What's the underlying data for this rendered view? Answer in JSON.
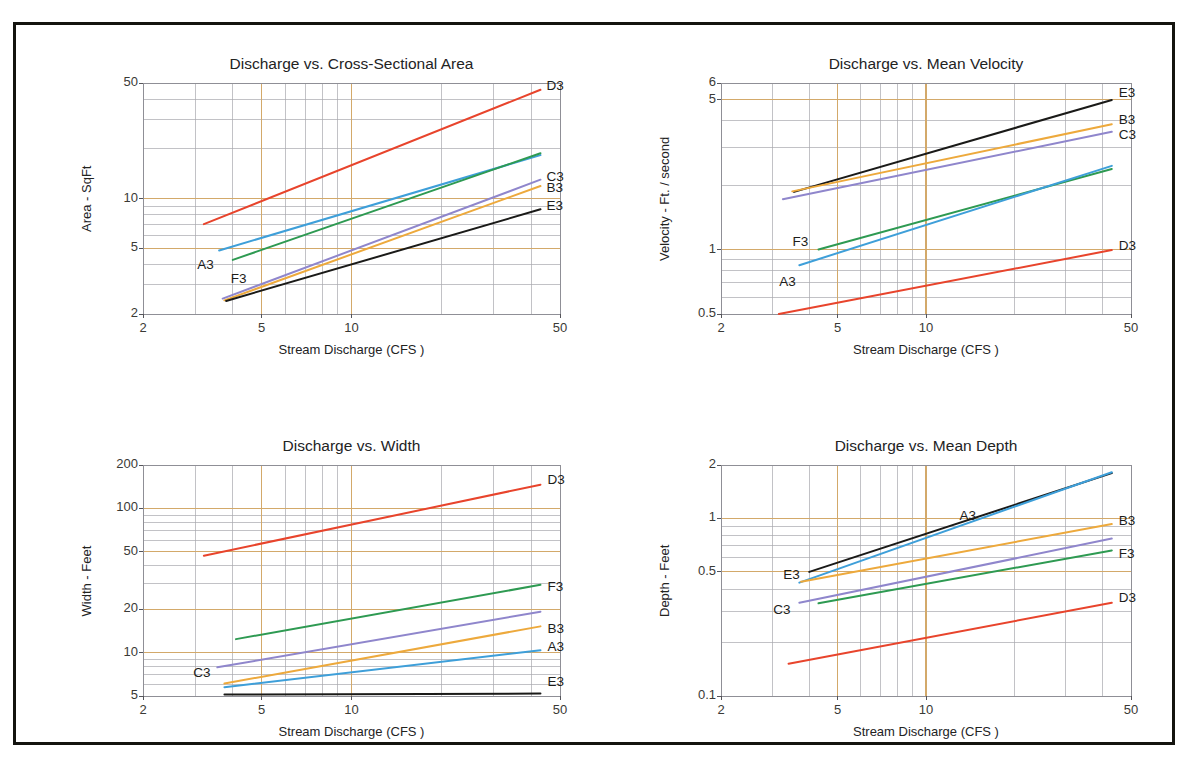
{
  "figure": {
    "border_color": "#14140f",
    "background": "#ffffff"
  },
  "palette": {
    "A3": "#3e9fd9",
    "B3": "#eda93c",
    "C3": "#8f86cc",
    "D3": "#e8442c",
    "E3": "#1a1a18",
    "F3": "#2e9a52",
    "grid_major": "#d3a96a",
    "grid_minor": "#a8a8ae",
    "axis": "#8f8f96"
  },
  "charts": [
    {
      "id": "area",
      "title": "Discharge vs. Cross-Sectional Area",
      "ylabel": "Area - SqFt",
      "xlabel": "Stream Discharge (CFS )",
      "x_ticks": [
        "2",
        "5",
        "10",
        "50"
      ],
      "x_tick_values": [
        2,
        5,
        10,
        50
      ],
      "y_ticks": [
        "50",
        "10",
        "5",
        "2"
      ],
      "y_tick_values": [
        50,
        10,
        5,
        2
      ],
      "xlim": [
        2,
        50
      ],
      "ylim": [
        2,
        50
      ],
      "series": [
        {
          "name": "A3",
          "color": "#3e9fd9",
          "x": [
            3.6,
            43
          ],
          "y": [
            4.85,
            18.3
          ],
          "label_pos": "left",
          "label_dx": -22,
          "label_dy": 16
        },
        {
          "name": "F3",
          "color": "#2e9a52",
          "x": [
            4.0,
            43
          ],
          "y": [
            4.25,
            18.8
          ],
          "label_pos": "left",
          "label_dx": -2,
          "label_dy": 20
        },
        {
          "name": "D3",
          "color": "#e8442c",
          "x": [
            3.2,
            43
          ],
          "y": [
            7.0,
            45.5
          ],
          "label_pos": "right",
          "label_dx": 6,
          "label_dy": -3
        },
        {
          "name": "C3",
          "color": "#8f86cc",
          "x": [
            3.7,
            43
          ],
          "y": [
            2.48,
            13.0
          ],
          "label_pos": "right",
          "label_dx": 6,
          "label_dy": -2
        },
        {
          "name": "B3",
          "color": "#eda93c",
          "x": [
            3.75,
            43
          ],
          "y": [
            2.42,
            11.9
          ],
          "label_pos": "right",
          "label_dx": 6,
          "label_dy": 3
        },
        {
          "name": "E3",
          "color": "#1a1a18",
          "x": [
            3.8,
            43
          ],
          "y": [
            2.4,
            8.6
          ],
          "label_pos": "right",
          "label_dx": 6,
          "label_dy": -2
        }
      ]
    },
    {
      "id": "velocity",
      "title": "Discharge vs. Mean Velocity",
      "ylabel": "Velocity - Ft. / second",
      "xlabel": "Stream Discharge (CFS )",
      "x_ticks": [
        "2",
        "5",
        "10",
        "50"
      ],
      "x_tick_values": [
        2,
        5,
        10,
        50
      ],
      "y_ticks": [
        "6",
        "5",
        "1",
        "0.5"
      ],
      "y_tick_values": [
        6,
        5,
        1,
        0.5
      ],
      "xlim": [
        2,
        50
      ],
      "ylim": [
        0.5,
        6
      ],
      "series": [
        {
          "name": "E3",
          "color": "#1a1a18",
          "x": [
            3.55,
            43
          ],
          "y": [
            1.86,
            5.0
          ],
          "label_pos": "right",
          "label_dx": 7,
          "label_dy": -6
        },
        {
          "name": "B3",
          "color": "#eda93c",
          "x": [
            3.5,
            43
          ],
          "y": [
            1.87,
            3.85
          ],
          "label_pos": "right",
          "label_dx": 7,
          "label_dy": -3
        },
        {
          "name": "C3",
          "color": "#8f86cc",
          "x": [
            3.25,
            43
          ],
          "y": [
            1.72,
            3.55
          ],
          "label_pos": "right",
          "label_dx": 7,
          "label_dy": 4
        },
        {
          "name": "F3",
          "color": "#2e9a52",
          "x": [
            4.3,
            43
          ],
          "y": [
            1.0,
            2.38
          ],
          "label_pos": "left",
          "label_dx": -26,
          "label_dy": -7
        },
        {
          "name": "A3",
          "color": "#3e9fd9",
          "x": [
            3.7,
            43
          ],
          "y": [
            0.845,
            2.46
          ],
          "label_pos": "left",
          "label_dx": -20,
          "label_dy": 18
        },
        {
          "name": "D3",
          "color": "#e8442c",
          "x": [
            3.15,
            43
          ],
          "y": [
            0.5,
            0.995
          ],
          "label_pos": "right",
          "label_dx": 7,
          "label_dy": -3
        }
      ]
    },
    {
      "id": "width",
      "title": "Discharge vs. Width",
      "ylabel": "Width - Feet",
      "xlabel": "Stream Discharge (CFS )",
      "x_ticks": [
        "2",
        "5",
        "10",
        "50"
      ],
      "x_tick_values": [
        2,
        5,
        10,
        50
      ],
      "y_ticks": [
        "200",
        "100",
        "50",
        "20",
        "10",
        "5"
      ],
      "y_tick_values": [
        200,
        100,
        50,
        20,
        10,
        5
      ],
      "xlim": [
        2,
        50
      ],
      "ylim": [
        5,
        200
      ],
      "series": [
        {
          "name": "D3",
          "color": "#e8442c",
          "x": [
            3.2,
            43
          ],
          "y": [
            47,
            146
          ],
          "label_pos": "right",
          "label_dx": 7,
          "label_dy": -4
        },
        {
          "name": "F3",
          "color": "#2e9a52",
          "x": [
            4.1,
            43
          ],
          "y": [
            12.4,
            29.5
          ],
          "label_pos": "right",
          "label_dx": 7,
          "label_dy": 3
        },
        {
          "name": "C3",
          "color": "#8f86cc",
          "x": [
            3.55,
            43
          ],
          "y": [
            7.9,
            19.2
          ],
          "label_pos": "left",
          "label_dx": -24,
          "label_dy": 7
        },
        {
          "name": "B3",
          "color": "#eda93c",
          "x": [
            3.75,
            43
          ],
          "y": [
            6.1,
            15.2
          ],
          "label_pos": "right",
          "label_dx": 7,
          "label_dy": 4
        },
        {
          "name": "A3",
          "color": "#3e9fd9",
          "x": [
            3.75,
            43
          ],
          "y": [
            5.75,
            10.4
          ],
          "label_pos": "right",
          "label_dx": 7,
          "label_dy": -2
        },
        {
          "name": "E3",
          "color": "#1a1a18",
          "x": [
            3.75,
            43
          ],
          "y": [
            5.12,
            5.2
          ],
          "label_pos": "right",
          "label_dx": 7,
          "label_dy": -11
        }
      ]
    },
    {
      "id": "depth",
      "title": "Discharge vs. Mean Depth",
      "ylabel": "Depth - Feet",
      "xlabel": "Stream Discharge (CFS )",
      "x_ticks": [
        "2",
        "5",
        "10",
        "50"
      ],
      "x_tick_values": [
        2,
        5,
        10,
        50
      ],
      "y_ticks": [
        "2",
        "1",
        "0.5",
        "0.1"
      ],
      "y_tick_values": [
        2,
        1,
        0.5,
        0.1
      ],
      "xlim": [
        2,
        50
      ],
      "ylim": [
        0.1,
        2
      ],
      "series": [
        {
          "name": "E3",
          "color": "#1a1a18",
          "x": [
            4.0,
            43
          ],
          "y": [
            0.5,
            1.8
          ],
          "label_pos": "left",
          "label_dx": -26,
          "label_dy": 4
        },
        {
          "name": "A3",
          "color": "#3e9fd9",
          "x": [
            3.7,
            43
          ],
          "y": [
            0.435,
            1.82
          ],
          "label_pos": "mid",
          "label_dx": 4,
          "label_dy": -10
        },
        {
          "name": "B3",
          "color": "#eda93c",
          "x": [
            3.75,
            43
          ],
          "y": [
            0.44,
            0.93
          ],
          "label_pos": "right",
          "label_dx": 7,
          "label_dy": -2
        },
        {
          "name": "C3",
          "color": "#8f86cc",
          "x": [
            3.7,
            43
          ],
          "y": [
            0.335,
            0.77
          ],
          "label_pos": "left",
          "label_dx": -26,
          "label_dy": 8
        },
        {
          "name": "F3",
          "color": "#2e9a52",
          "x": [
            4.3,
            43
          ],
          "y": [
            0.333,
            0.66
          ],
          "label_pos": "right",
          "label_dx": 7,
          "label_dy": 5
        },
        {
          "name": "D3",
          "color": "#e8442c",
          "x": [
            3.4,
            43
          ],
          "y": [
            0.152,
            0.335
          ],
          "label_pos": "right",
          "label_dx": 7,
          "label_dy": -4
        }
      ]
    }
  ],
  "chart_data": [
    {
      "type": "line",
      "title": "Discharge vs. Cross-Sectional Area",
      "xlabel": "Stream Discharge (CFS )",
      "ylabel": "Area - SqFt",
      "xscale": "log",
      "yscale": "log",
      "xlim": [
        2,
        50
      ],
      "ylim": [
        2,
        50
      ],
      "xticks": [
        2,
        5,
        10,
        50
      ],
      "yticks": [
        2,
        5,
        10,
        50
      ],
      "grid": true,
      "legend": "inline-end-labels",
      "series": [
        {
          "name": "A3",
          "x": [
            3.6,
            43
          ],
          "y": [
            4.85,
            18.3
          ]
        },
        {
          "name": "B3",
          "x": [
            3.75,
            43
          ],
          "y": [
            2.42,
            11.9
          ]
        },
        {
          "name": "C3",
          "x": [
            3.7,
            43
          ],
          "y": [
            2.48,
            13.0
          ]
        },
        {
          "name": "D3",
          "x": [
            3.2,
            43
          ],
          "y": [
            7.0,
            45.5
          ]
        },
        {
          "name": "E3",
          "x": [
            3.8,
            43
          ],
          "y": [
            2.4,
            8.6
          ]
        },
        {
          "name": "F3",
          "x": [
            4.0,
            43
          ],
          "y": [
            4.25,
            18.8
          ]
        }
      ]
    },
    {
      "type": "line",
      "title": "Discharge vs. Mean Velocity",
      "xlabel": "Stream Discharge (CFS )",
      "ylabel": "Velocity - Ft. / second",
      "xscale": "log",
      "yscale": "log",
      "xlim": [
        2,
        50
      ],
      "ylim": [
        0.5,
        6
      ],
      "xticks": [
        2,
        5,
        10,
        50
      ],
      "yticks": [
        0.5,
        1,
        5,
        6
      ],
      "grid": true,
      "legend": "inline-end-labels",
      "series": [
        {
          "name": "A3",
          "x": [
            3.7,
            43
          ],
          "y": [
            0.845,
            2.46
          ]
        },
        {
          "name": "B3",
          "x": [
            3.5,
            43
          ],
          "y": [
            1.87,
            3.85
          ]
        },
        {
          "name": "C3",
          "x": [
            3.25,
            43
          ],
          "y": [
            1.72,
            3.55
          ]
        },
        {
          "name": "D3",
          "x": [
            3.15,
            43
          ],
          "y": [
            0.5,
            0.995
          ]
        },
        {
          "name": "E3",
          "x": [
            3.55,
            43
          ],
          "y": [
            1.86,
            5.0
          ]
        },
        {
          "name": "F3",
          "x": [
            4.3,
            43
          ],
          "y": [
            1.0,
            2.38
          ]
        }
      ]
    },
    {
      "type": "line",
      "title": "Discharge vs. Width",
      "xlabel": "Stream Discharge (CFS )",
      "ylabel": "Width - Feet",
      "xscale": "log",
      "yscale": "log",
      "xlim": [
        2,
        50
      ],
      "ylim": [
        5,
        200
      ],
      "xticks": [
        2,
        5,
        10,
        50
      ],
      "yticks": [
        5,
        10,
        20,
        50,
        100,
        200
      ],
      "grid": true,
      "legend": "inline-end-labels",
      "series": [
        {
          "name": "A3",
          "x": [
            3.75,
            43
          ],
          "y": [
            5.75,
            10.4
          ]
        },
        {
          "name": "B3",
          "x": [
            3.75,
            43
          ],
          "y": [
            6.1,
            15.2
          ]
        },
        {
          "name": "C3",
          "x": [
            3.55,
            43
          ],
          "y": [
            7.9,
            19.2
          ]
        },
        {
          "name": "D3",
          "x": [
            3.2,
            43
          ],
          "y": [
            47,
            146
          ]
        },
        {
          "name": "E3",
          "x": [
            3.75,
            43
          ],
          "y": [
            5.12,
            5.2
          ]
        },
        {
          "name": "F3",
          "x": [
            4.1,
            43
          ],
          "y": [
            12.4,
            29.5
          ]
        }
      ]
    },
    {
      "type": "line",
      "title": "Discharge vs. Mean Depth",
      "xlabel": "Stream Discharge (CFS )",
      "ylabel": "Depth - Feet",
      "xscale": "log",
      "yscale": "log",
      "xlim": [
        2,
        50
      ],
      "ylim": [
        0.1,
        2
      ],
      "xticks": [
        2,
        5,
        10,
        50
      ],
      "yticks": [
        0.1,
        0.5,
        1,
        2
      ],
      "grid": true,
      "legend": "inline-end-labels",
      "series": [
        {
          "name": "A3",
          "x": [
            3.7,
            43
          ],
          "y": [
            0.435,
            1.82
          ]
        },
        {
          "name": "B3",
          "x": [
            3.75,
            43
          ],
          "y": [
            0.44,
            0.93
          ]
        },
        {
          "name": "C3",
          "x": [
            3.7,
            43
          ],
          "y": [
            0.335,
            0.77
          ]
        },
        {
          "name": "D3",
          "x": [
            3.4,
            43
          ],
          "y": [
            0.152,
            0.335
          ]
        },
        {
          "name": "E3",
          "x": [
            4.0,
            43
          ],
          "y": [
            0.5,
            1.8
          ]
        },
        {
          "name": "F3",
          "x": [
            4.3,
            43
          ],
          "y": [
            0.333,
            0.66
          ]
        }
      ]
    }
  ]
}
